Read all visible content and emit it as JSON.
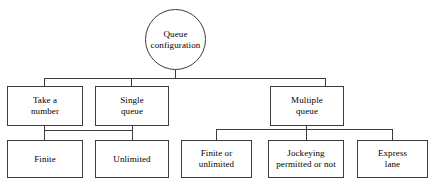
{
  "diagram": {
    "title": "Queue configuration",
    "type": "tree-hierarchy",
    "root": {
      "id": "queue-configuration",
      "label": "Queue\nconfiguration",
      "shape": "circle"
    },
    "level2": [
      {
        "id": "take-a-number",
        "label": "Take a\nnumber",
        "shape": "rect"
      },
      {
        "id": "single-queue",
        "label": "Single\nqueue",
        "shape": "rect"
      },
      {
        "id": "multiple-queue",
        "label": "Multiple\nqueue",
        "shape": "rect"
      }
    ],
    "level3": [
      {
        "id": "finite",
        "label": "Finite",
        "shape": "rect",
        "parent": "take-a-number"
      },
      {
        "id": "unlimited",
        "label": "Unlimited",
        "shape": "rect",
        "parent": "single-queue"
      },
      {
        "id": "finite-or-unlimited",
        "label": "Finite or\nunlimited",
        "shape": "rect",
        "parent": "multiple-queue"
      },
      {
        "id": "jockeying-permitted-or-not",
        "label": "Jockeying\npermitted or not",
        "shape": "rect",
        "parent": "multiple-queue"
      },
      {
        "id": "express-lane",
        "label": "Express\nlane",
        "shape": "rect",
        "parent": "multiple-queue"
      }
    ],
    "colors": {
      "line": "#3c3c3c",
      "text": "#000000",
      "background": "#ffffff"
    }
  }
}
